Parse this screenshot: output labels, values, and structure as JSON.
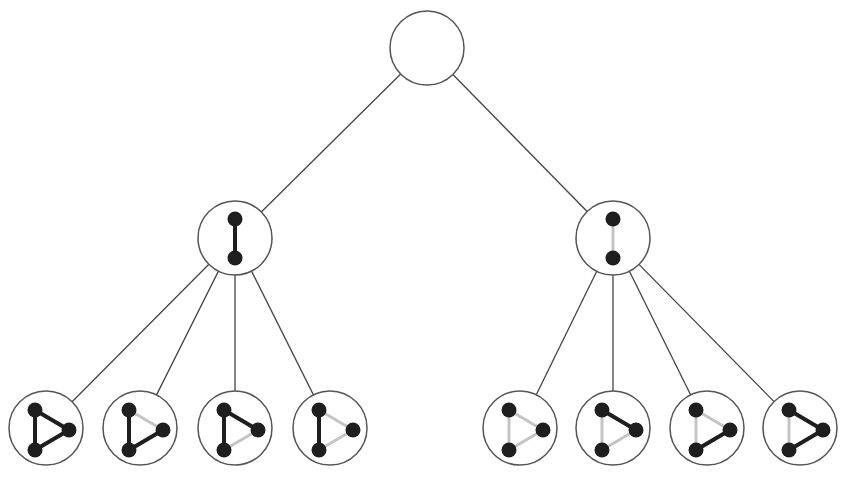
{
  "diagram": {
    "type": "tree",
    "colors": {
      "node_stroke": "#555555",
      "tree_edge": "#444444",
      "vertex_fill": "#1e1e1e",
      "edge_present": "#1e1e1e",
      "edge_absent": "#c4c4c4",
      "background": "#ffffff"
    },
    "root": {
      "id": "root",
      "cx": 427,
      "cy": 48,
      "r": 37,
      "content": "empty"
    },
    "level1": [
      {
        "id": "mid-left",
        "cx": 235,
        "cy": 238,
        "r": 37,
        "edge": "present"
      },
      {
        "id": "mid-right",
        "cx": 613,
        "cy": 238,
        "r": 37,
        "edge": "absent"
      }
    ],
    "leaves": [
      {
        "id": "leaf-1",
        "parent": "mid-left",
        "cx": 46,
        "cy": 428,
        "left": "present",
        "top_right": "present",
        "bottom_right": "present"
      },
      {
        "id": "leaf-2",
        "parent": "mid-left",
        "cx": 140,
        "cy": 428,
        "left": "present",
        "top_right": "absent",
        "bottom_right": "present"
      },
      {
        "id": "leaf-3",
        "parent": "mid-left",
        "cx": 235,
        "cy": 428,
        "left": "present",
        "top_right": "present",
        "bottom_right": "absent"
      },
      {
        "id": "leaf-4",
        "parent": "mid-left",
        "cx": 330,
        "cy": 428,
        "left": "present",
        "top_right": "absent",
        "bottom_right": "absent"
      },
      {
        "id": "leaf-5",
        "parent": "mid-right",
        "cx": 520,
        "cy": 428,
        "left": "absent",
        "top_right": "absent",
        "bottom_right": "absent"
      },
      {
        "id": "leaf-6",
        "parent": "mid-right",
        "cx": 613,
        "cy": 428,
        "left": "absent",
        "top_right": "present",
        "bottom_right": "absent"
      },
      {
        "id": "leaf-7",
        "parent": "mid-right",
        "cx": 707,
        "cy": 428,
        "left": "absent",
        "top_right": "absent",
        "bottom_right": "present"
      },
      {
        "id": "leaf-8",
        "parent": "mid-right",
        "cx": 800,
        "cy": 428,
        "left": "absent",
        "top_right": "present",
        "bottom_right": "present"
      }
    ]
  }
}
